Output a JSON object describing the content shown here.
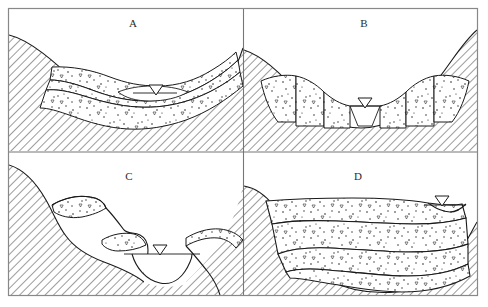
{
  "figure": {
    "title": "",
    "frame": {
      "x": 8,
      "y": 8,
      "width": 470,
      "height": 288,
      "border_color": "#888888"
    },
    "background_color": "#ffffff",
    "line_color": "#1a1a1a",
    "hatch_color": "#3a3a3a",
    "stipple_color": "#222222"
  },
  "panels": [
    {
      "id": "A",
      "label": "A",
      "label_x": 133,
      "label_y": 27,
      "description": "Broad alluvial valley fill with paired fill terraces and water table",
      "water_table": {
        "symbol": "water-table-triangle",
        "x": 155,
        "y": 90
      }
    },
    {
      "id": "B",
      "label": "B",
      "label_x": 364,
      "label_y": 27,
      "description": "Paired stepped fill terraces flanking narrow channel",
      "water_table": {
        "symbol": "water-table-triangle",
        "x": 365,
        "y": 100
      }
    },
    {
      "id": "C",
      "label": "C",
      "label_x": 129,
      "label_y": 180,
      "description": "Unpaired rock-cut strath terraces with thin gravel caps",
      "water_table": {
        "symbol": "water-table-triangle",
        "x": 160,
        "y": 247
      }
    },
    {
      "id": "D",
      "label": "D",
      "label_x": 358,
      "label_y": 180,
      "description": "Thick stacked valley fill with three depositional units",
      "water_table": {
        "symbol": "water-table-triangle",
        "x": 442,
        "y": 205
      }
    }
  ],
  "legend_symbols": {
    "bedrock": "diagonal-hatching",
    "alluvium": "stipple-and-pebbles",
    "water_table": "inverted-triangle"
  }
}
